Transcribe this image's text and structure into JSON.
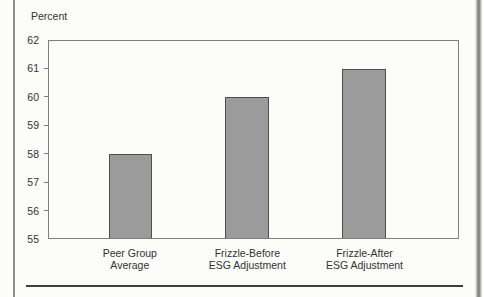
{
  "chart_data": {
    "type": "bar",
    "title": "",
    "ylabel": "Percent",
    "xlabel": "",
    "categories": [
      [
        "Peer Group",
        "Average"
      ],
      [
        "Frizzle-Before",
        "ESG Adjustment"
      ],
      [
        "Frizzle-After",
        "ESG Adjustment"
      ]
    ],
    "values": [
      58,
      60,
      61
    ],
    "ylim": [
      55,
      62
    ],
    "yticks": [
      55,
      56,
      57,
      58,
      59,
      60,
      61,
      62
    ],
    "grid": false,
    "legend": "none",
    "colors": {
      "bar_fill": "#9b9b9b",
      "bar_border": "#4e4e4e",
      "axis": "#7f7f7f",
      "text": "#333333",
      "page_bg": "#fcfcf9",
      "rule": "#3e3e3e",
      "edge_line": "#8f8f8f"
    },
    "layout": {
      "plot_px": {
        "left": 48,
        "top": 40,
        "width": 411,
        "height": 199
      },
      "bar_centers_pct": [
        19.9,
        48.5,
        77.0
      ],
      "bar_width_pct": 10.7,
      "legend_position": "none"
    }
  }
}
